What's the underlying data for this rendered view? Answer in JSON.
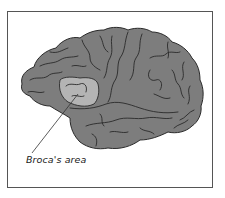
{
  "figure": {
    "label": "Broca's area",
    "colors": {
      "frame_border": "#555555",
      "brain_fill": "#7d7d7d",
      "highlight_fill": "#b4b4b4",
      "outline": "#2a2a2a",
      "leader_line": "#333333",
      "background": "#ffffff"
    }
  }
}
